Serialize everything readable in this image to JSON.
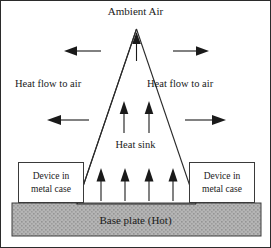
{
  "figure": {
    "labels": {
      "ambient_air": "Ambient Air",
      "heat_flow_left": "Heat flow to air",
      "heat_flow_right": "Heat flow to air",
      "heat_sink": "Heat sink",
      "base_plate": "Base plate (Hot)",
      "device_left_line1": "Device in",
      "device_left_line2": "metal case",
      "device_right_line1": "Device in",
      "device_right_line2": "metal case"
    },
    "colors": {
      "line": "#1a1a1a",
      "text": "#1a1a1a",
      "base_plate_fill": "#b3b3b3",
      "base_plate_stipple": "#8f8f8f",
      "device_fill": "#ffffff",
      "background": "#ffffff",
      "frame": "#2b2b2b"
    },
    "icons": {
      "arrow_up": "up-arrow-icon",
      "arrow_left": "left-arrow-icon",
      "arrow_right": "right-arrow-icon"
    },
    "counts": {
      "upper_vertical_arrows": 2,
      "lower_vertical_arrows": 4,
      "left_horizontal_arrows": 2,
      "right_horizontal_arrows": 2,
      "apex_arrows": 1
    }
  }
}
